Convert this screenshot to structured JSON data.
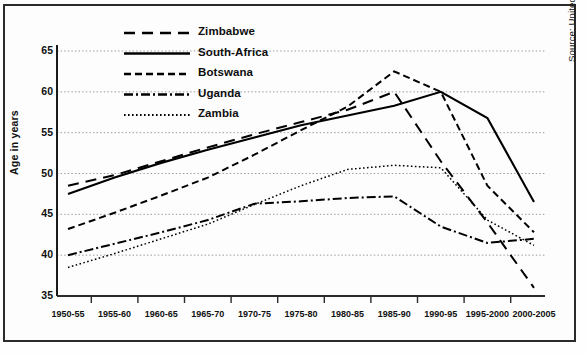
{
  "figure": {
    "y_axis_title": "Age in years",
    "source_note": "Source: United Nations Population Division, 2000"
  },
  "chart_data": {
    "type": "line",
    "title": "",
    "xlabel": "",
    "ylabel": "Age in years",
    "ylim": [
      35,
      65
    ],
    "yticks": [
      35,
      40,
      45,
      50,
      55,
      60,
      65
    ],
    "grid": true,
    "legend_position": "top-center-inside",
    "categories": [
      "1950-55",
      "1955-60",
      "1960-65",
      "1965-70",
      "1970-75",
      "1975-80",
      "1980-85",
      "1985-90",
      "1990-95",
      "1995-2000",
      "2000-2005"
    ],
    "series": [
      {
        "name": "Zimbabwe",
        "style": "dashed-long",
        "color": "#000000",
        "values": [
          48.5,
          49.8,
          51.5,
          53.2,
          54.8,
          56.3,
          57.8,
          60.0,
          51.5,
          44.0,
          36.0
        ]
      },
      {
        "name": "South-Africa",
        "style": "solid",
        "color": "#000000",
        "values": [
          47.5,
          49.5,
          51.3,
          52.9,
          54.4,
          55.9,
          57.1,
          58.3,
          60.0,
          56.8,
          46.5
        ]
      },
      {
        "name": "Botswana",
        "style": "dashed-short",
        "color": "#000000",
        "values": [
          43.2,
          45.2,
          47.3,
          49.5,
          52.3,
          55.3,
          58.2,
          62.5,
          60.0,
          48.5,
          42.8
        ]
      },
      {
        "name": "Uganda",
        "style": "dash-dot",
        "color": "#000000",
        "values": [
          40.0,
          41.4,
          42.8,
          44.3,
          46.3,
          46.6,
          47.0,
          47.2,
          43.5,
          41.5,
          42.0
        ]
      },
      {
        "name": "Zambia",
        "style": "dotted",
        "color": "#000000",
        "values": [
          38.5,
          40.2,
          42.0,
          43.8,
          46.2,
          48.5,
          50.5,
          51.0,
          50.7,
          44.3,
          41.2
        ]
      }
    ]
  },
  "legend": {
    "items": [
      {
        "label": "Zimbabwe"
      },
      {
        "label": "South-Africa"
      },
      {
        "label": "Botswana"
      },
      {
        "label": "Uganda"
      },
      {
        "label": "Zambia"
      }
    ]
  }
}
